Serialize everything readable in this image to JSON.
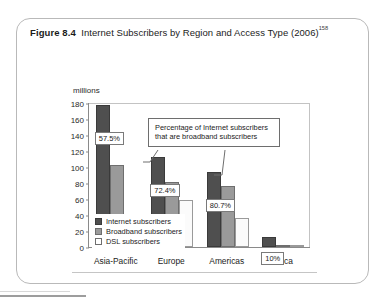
{
  "figure": {
    "label": "Figure 8.4",
    "title": "Internet Subscribers by Region and Access Type (2006)",
    "superscript": "158"
  },
  "annotation": {
    "line1": "Percentage of Internet subscribers",
    "line2": "that are broadband subscribers"
  },
  "axis": {
    "unit": "millions"
  },
  "chart_data": {
    "type": "bar",
    "title": "Internet Subscribers by Region and Access Type (2006)",
    "xlabel": "",
    "ylabel": "millions",
    "ylim": [
      0,
      180
    ],
    "yticks": [
      0,
      20,
      40,
      60,
      80,
      100,
      120,
      140,
      160,
      180
    ],
    "grid": false,
    "legend_position": "inside-bottom-left",
    "categories": [
      "Asia-Pacific",
      "Europe",
      "Americas",
      "Africa"
    ],
    "series": [
      {
        "name": "Internet subscribers",
        "values": [
          178,
          112,
          94,
          12
        ]
      },
      {
        "name": "Broadband subscribers",
        "values": [
          103,
          81,
          76,
          1.2
        ]
      },
      {
        "name": "DSL subscribers",
        "values": [
          8,
          59,
          36,
          0.8
        ]
      }
    ],
    "annotations": [
      {
        "category": "Asia-Pacific",
        "text": "57.5%"
      },
      {
        "category": "Europe",
        "text": "72.4%"
      },
      {
        "category": "Americas",
        "text": "80.7%"
      },
      {
        "category": "Africa",
        "text": "10%"
      }
    ],
    "callout": "Percentage of Internet subscribers that are broadband subscribers"
  }
}
